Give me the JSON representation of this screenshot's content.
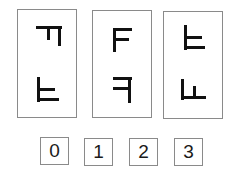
{
  "puzzle": {
    "type": "mental-rotation",
    "colors": {
      "stroke": "#111111",
      "border": "#8a8a8a",
      "background": "#ffffff"
    },
    "cards": [
      {
        "index": 0,
        "top_glyph": "F rotated 90 degrees clockwise",
        "bottom_glyph": "F flipped vertically"
      },
      {
        "index": 1,
        "top_glyph": "F upright",
        "bottom_glyph": "F mirrored horizontally"
      },
      {
        "index": 2,
        "top_glyph": "F flipped vertically",
        "bottom_glyph": "F rotated 90 degrees counter-clockwise"
      }
    ],
    "answers": [
      {
        "label": "0"
      },
      {
        "label": "1"
      },
      {
        "label": "2"
      },
      {
        "label": "3"
      }
    ]
  }
}
